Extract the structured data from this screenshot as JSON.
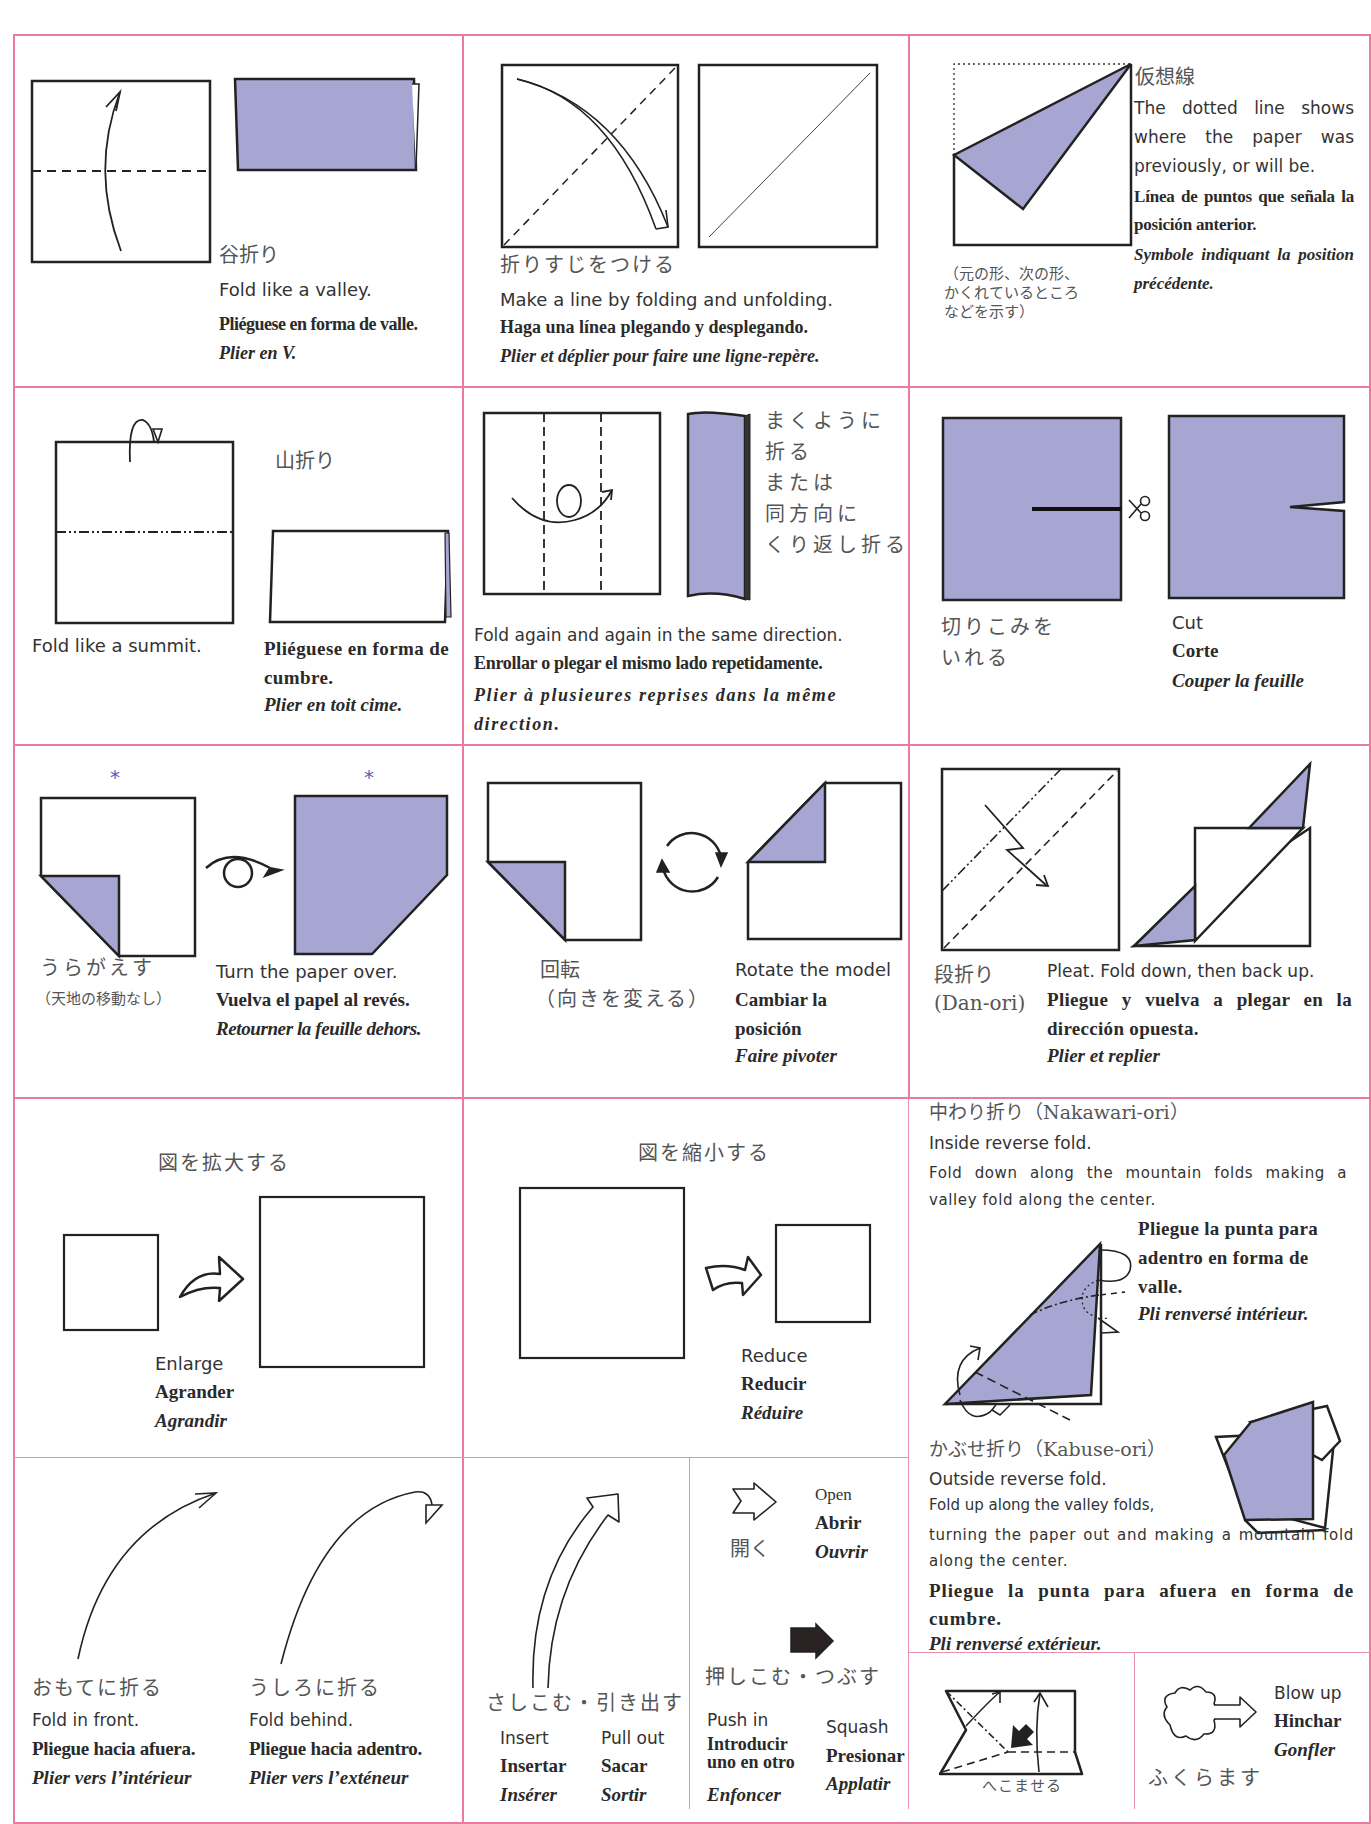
{
  "colors": {
    "border": "#e97aa2",
    "paper_fill": "#a7a6d2",
    "stroke": "#222222",
    "asterisk": "#5560b8"
  },
  "cells": {
    "valley": {
      "jp": "谷折り",
      "en": "Fold like a valley.",
      "es": "Pliéguese en forma de valle.",
      "fr": "Plier en V."
    },
    "crease": {
      "jp": "折りすじをつける",
      "en": "Make a line by folding and unfolding.",
      "es": "Haga una línea plegando y desplegando.",
      "fr": "Plier et déplier pour faire une ligne-repère."
    },
    "hidden_line": {
      "jp": "仮想線",
      "jp_note_1": "（元の形、次の形、",
      "jp_note_2": "かくれているところ",
      "jp_note_3": "などを示す）",
      "en": "The dotted line shows where the paper was previously, or will be.",
      "es": "Línea de puntos que señala la posición anterior.",
      "fr": "Symbole indiquant la position précédente."
    },
    "mountain": {
      "jp": "山折り",
      "en": "Fold like a summit.",
      "es": "Pliéguese en forma de cumbre.",
      "fr": "Plier en toit cime."
    },
    "roll": {
      "jp_1": "まくように",
      "jp_2": "折る",
      "jp_3": "または",
      "jp_4": "同方向に",
      "jp_5": "くり返し折る",
      "en": "Fold again and again in the same direction.",
      "es": "Enrollar o plegar el mismo lado repetidamente.",
      "fr": "Plier à plusieures reprises dans la même direction."
    },
    "cut": {
      "jp_1": "切りこみを",
      "jp_2": "いれる",
      "en": "Cut",
      "es": "Corte",
      "fr": "Couper la feuille"
    },
    "turn_over": {
      "jp": "うらがえす",
      "jp_note": "（天地の移動なし）",
      "en": "Turn the paper over.",
      "es": "Vuelva el papel al revés.",
      "fr": "Retourner la feuille dehors.",
      "marker": "*"
    },
    "rotate": {
      "jp_1": "回転",
      "jp_2": "（向きを変える）",
      "en": "Rotate the model",
      "es": "Cambiar la posición",
      "fr": "Faire pivoter"
    },
    "pleat": {
      "jp_1": "段折り",
      "jp_2": "(Dan-ori)",
      "en": "Pleat. Fold down, then back up.",
      "es": "Pliegue y vuelva a plegar en la dirección opuesta.",
      "fr": "Plier et replier"
    },
    "enlarge": {
      "jp": "図を拡大する",
      "en": "Enlarge",
      "es": "Agrander",
      "fr": "Agrandir"
    },
    "reduce": {
      "jp": "図を縮小する",
      "en": "Reduce",
      "es": "Reducir",
      "fr": "Réduire"
    },
    "inside_reverse": {
      "jp": "中わり折り（Nakawari-ori）",
      "en_title": "Inside reverse fold.",
      "en": "Fold down along the mountain folds making a valley fold along the center.",
      "es": "Pliegue la punta para adentro en forma de valle.",
      "fr": "Pli renversé intérieur."
    },
    "outside_reverse": {
      "jp": "かぶせ折り（Kabuse-ori）",
      "en_title": "Outside reverse fold.",
      "en_1": "Fold up along the valley folds,",
      "en_2": "turning the paper out and making a mountain fold along the center.",
      "es": "Pliegue la punta para afuera en forma de cumbre.",
      "fr": "Pli renversé extérieur."
    },
    "fold_front": {
      "jp": "おもてに折る",
      "en": "Fold in front.",
      "es": "Pliegue hacia afuera.",
      "fr": "Plier vers l’intérieur"
    },
    "fold_behind": {
      "jp": "うしろに折る",
      "en": "Fold behind.",
      "es": "Pliegue hacia adentro.",
      "fr": "Plier vers l’exténeur"
    },
    "insert_pull": {
      "jp": "さしこむ・引き出す",
      "insert_en": "Insert",
      "insert_es": "Insertar",
      "insert_fr": "Insérer",
      "pull_en": "Pull out",
      "pull_es": "Sacar",
      "pull_fr": "Sortir"
    },
    "open": {
      "jp": "開く",
      "en": "Open",
      "es": "Abrir",
      "fr": "Ouvrir"
    },
    "push_squash": {
      "jp": "押しこむ・つぶす",
      "push_en": "Push in",
      "push_es": "Introducir uno en otro",
      "push_fr": "Enfoncer",
      "squash_en": "Squash",
      "squash_es": "Presionar",
      "squash_fr": "Applatir"
    },
    "sink": {
      "jp": "へこませる"
    },
    "blow_up": {
      "jp": "ふくらます",
      "en": "Blow up",
      "es": "Hinchar",
      "fr": "Gonfler"
    }
  }
}
